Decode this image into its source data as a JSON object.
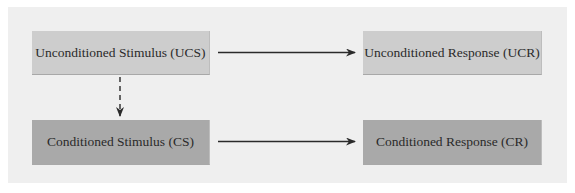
{
  "diagram": {
    "nodes": [
      {
        "id": "ucs",
        "label": "Unconditioned Stimulus (UCS)",
        "shade": "light"
      },
      {
        "id": "ucr",
        "label": "Unconditioned Response (UCR)",
        "shade": "light"
      },
      {
        "id": "cs",
        "label": "Conditioned Stimulus (CS)",
        "shade": "dark"
      },
      {
        "id": "cr",
        "label": "Conditioned Response (CR)",
        "shade": "dark"
      }
    ],
    "edges": [
      {
        "from": "ucs",
        "to": "ucr",
        "style": "solid"
      },
      {
        "from": "cs",
        "to": "cr",
        "style": "solid"
      },
      {
        "from": "ucs",
        "to": "cs",
        "style": "dashed"
      }
    ],
    "colors": {
      "background": "#efefef",
      "light_box": "#cdcdcd",
      "dark_box": "#a9a9a9",
      "arrow": "#2a2a2a"
    }
  }
}
